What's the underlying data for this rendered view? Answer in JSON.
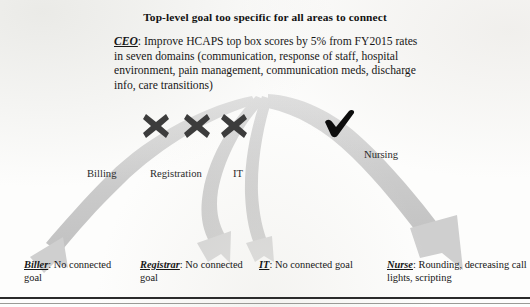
{
  "title": "Top-level goal too specific for all areas to connect",
  "ceo": {
    "key": "CEO",
    "separator": ":",
    "text": " Improve HCAPS top box scores by 5% from FY2015 rates in seven domains (communication, response of staff, hospital environment, pain management, communication meds, discharge info, care transitions)"
  },
  "branch_labels": {
    "billing": "Billing",
    "registration": "Registration",
    "it": "IT",
    "nursing": "Nursing"
  },
  "markers": {
    "billing": "x-mark",
    "registration": "x-mark",
    "it": "x-mark",
    "nursing": "check-mark"
  },
  "leaves": [
    {
      "key": "Biller",
      "separator": ":",
      "text": " No connected goal"
    },
    {
      "key": "Registrar",
      "separator": ":",
      "text": " No connected goal"
    },
    {
      "key": "IT",
      "separator": ":",
      "text": " No connected goal"
    },
    {
      "key": "Nurse",
      "separator": ":",
      "text": " Rounding, decreasing call lights, scripting"
    }
  ],
  "colors": {
    "arrow_gray": "#c9c9c9",
    "arrow_gray_light": "#d6d6d6",
    "x_mark_black": "#3a3a3a",
    "check_black": "#0d0d0d",
    "text_black": "#171717",
    "rule_black": "#2b2b2b",
    "page_background": "#fdfdfc"
  }
}
